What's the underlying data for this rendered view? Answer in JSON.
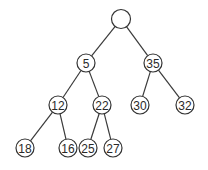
{
  "diagram": {
    "type": "binary-tree",
    "node_radius": 9,
    "nodes": [
      {
        "id": "root",
        "label": "",
        "x": 121,
        "y": 19
      },
      {
        "id": "n5",
        "label": "5",
        "x": 86,
        "y": 63
      },
      {
        "id": "n35",
        "label": "35",
        "x": 153,
        "y": 63
      },
      {
        "id": "n12",
        "label": "12",
        "x": 58,
        "y": 105
      },
      {
        "id": "n22",
        "label": "22",
        "x": 102,
        "y": 105
      },
      {
        "id": "n30",
        "label": "30",
        "x": 140,
        "y": 105
      },
      {
        "id": "n32",
        "label": "32",
        "x": 185,
        "y": 105
      },
      {
        "id": "n18",
        "label": "18",
        "x": 25,
        "y": 148
      },
      {
        "id": "n16",
        "label": "16",
        "x": 68,
        "y": 148
      },
      {
        "id": "n25",
        "label": "25",
        "x": 88,
        "y": 148
      },
      {
        "id": "n27",
        "label": "27",
        "x": 113,
        "y": 148
      }
    ],
    "edges": [
      [
        "root",
        "n5"
      ],
      [
        "root",
        "n35"
      ],
      [
        "n5",
        "n12"
      ],
      [
        "n5",
        "n22"
      ],
      [
        "n35",
        "n30"
      ],
      [
        "n35",
        "n32"
      ],
      [
        "n12",
        "n18"
      ],
      [
        "n12",
        "n16"
      ],
      [
        "n22",
        "n25"
      ],
      [
        "n22",
        "n27"
      ]
    ]
  }
}
